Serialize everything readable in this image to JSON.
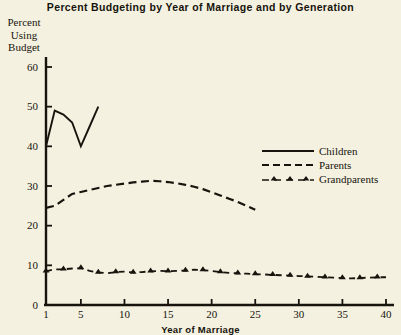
{
  "chart_data": {
    "type": "line",
    "title": "Percent Budgeting by Year of Marriage and by Generation",
    "xlabel": "Year of Marriage",
    "ylabel": "Percent Using Budget",
    "ylabel_lines": [
      "Percent",
      "Using",
      "Budget"
    ],
    "xlim": [
      1,
      40
    ],
    "ylim": [
      0,
      60
    ],
    "xticks": [
      1,
      5,
      10,
      15,
      20,
      25,
      30,
      35,
      40
    ],
    "yticks": [
      0,
      10,
      20,
      30,
      40,
      50,
      60
    ],
    "grid": false,
    "legend_position": "center-right",
    "series": [
      {
        "name": "Children",
        "style": "solid",
        "marker": "none",
        "x": [
          1,
          2,
          3,
          4,
          5,
          6,
          7
        ],
        "values": [
          40,
          49,
          48,
          46,
          40,
          45,
          50
        ]
      },
      {
        "name": "Parents",
        "style": "dashed",
        "marker": "none",
        "x": [
          1,
          2,
          3,
          4,
          5,
          6,
          7,
          8,
          9,
          10,
          11,
          12,
          13,
          14,
          15,
          16,
          17,
          18,
          19,
          20,
          21,
          22,
          23,
          24,
          25
        ],
        "values": [
          24.5,
          25,
          26.5,
          28,
          28.5,
          29,
          29.5,
          30,
          30.3,
          30.6,
          30.9,
          31.1,
          31.3,
          31.2,
          31,
          30.7,
          30.3,
          29.8,
          29.2,
          28.4,
          27.6,
          26.8,
          26,
          25,
          24
        ]
      },
      {
        "name": "Grandparents",
        "style": "dash-dot",
        "marker": "triangle",
        "x": [
          1,
          2,
          3,
          4,
          5,
          6,
          7,
          8,
          9,
          10,
          11,
          12,
          13,
          14,
          15,
          16,
          17,
          18,
          19,
          20,
          21,
          22,
          23,
          24,
          25,
          26,
          27,
          28,
          29,
          30,
          31,
          32,
          33,
          34,
          35,
          36,
          37,
          38,
          39,
          40
        ],
        "values": [
          8.5,
          9,
          9,
          9.2,
          9.3,
          8.6,
          8.2,
          8.0,
          8.3,
          8.4,
          8.2,
          8.3,
          8.5,
          8.6,
          8.5,
          8.6,
          8.7,
          8.9,
          8.8,
          8.6,
          8.3,
          8.1,
          8.0,
          7.9,
          7.8,
          7.7,
          7.6,
          7.5,
          7.4,
          7.3,
          7.2,
          7.1,
          7.0,
          6.9,
          6.8,
          6.7,
          6.8,
          6.9,
          7.0,
          7.0
        ]
      }
    ],
    "colors": {
      "background": "#f4f1e0",
      "ink": "#17140d",
      "axis": "#17140d"
    }
  },
  "legend": {
    "items": [
      {
        "label": "Children"
      },
      {
        "label": "Parents"
      },
      {
        "label": "Grandparents"
      }
    ]
  }
}
